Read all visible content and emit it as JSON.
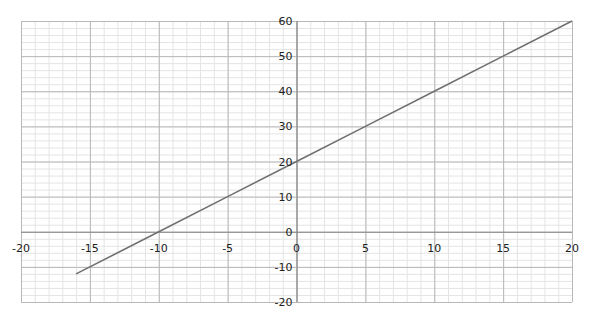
{
  "chart_data": {
    "type": "line",
    "title": "",
    "xlabel": "",
    "ylabel": "",
    "xlim": [
      -20,
      20
    ],
    "ylim": [
      -20,
      60
    ],
    "grid": true,
    "minor_grid": true,
    "legend": null,
    "x_ticks": [
      -20,
      -15,
      -10,
      -5,
      0,
      5,
      10,
      15,
      20
    ],
    "y_ticks": [
      -20,
      -10,
      0,
      10,
      20,
      30,
      40,
      50,
      60
    ],
    "x_tick_labels": [
      "-20",
      "-15",
      "-10",
      "-5",
      "0",
      "5",
      "10",
      "15",
      "20"
    ],
    "y_tick_labels": [
      "-20",
      "-10",
      "0",
      "10",
      "20",
      "30",
      "40",
      "50",
      "60"
    ],
    "series": [
      {
        "name": "y = 2x + 20",
        "equation": "y = 2x + 20",
        "x": [
          -16,
          -10,
          -5,
          0,
          5,
          10,
          15,
          20
        ],
        "values": [
          -12,
          0,
          10,
          20,
          30,
          40,
          50,
          60
        ],
        "color": "#707070"
      }
    ]
  },
  "colors": {
    "major_grid": "#b8b8b8",
    "minor_grid": "#e4e4e4",
    "axis": "#8a8a8a",
    "line": "#707070",
    "text": "#222222"
  }
}
